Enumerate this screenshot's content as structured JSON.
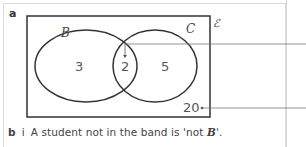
{
  "part_label": "a",
  "venn": {
    "universal_symbol": "ℰ",
    "set_b_label": "B",
    "set_c_label": "C",
    "region_b_only": "3",
    "region_b_and_c": "2",
    "region_c_only": "5",
    "region_outside": "20",
    "colors": {
      "lines": "#333333",
      "text": "#555555",
      "pointer": "#666666"
    }
  },
  "caption": {
    "part": "b",
    "subpart": "i",
    "text_before": "A student not in the band is 'not ",
    "set_name": "B",
    "text_after": "'."
  }
}
